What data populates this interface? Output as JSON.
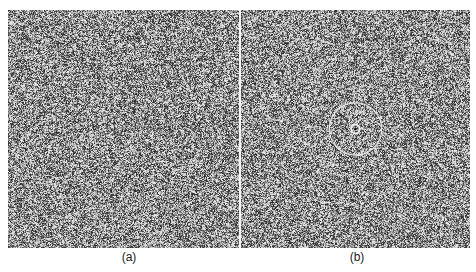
{
  "figure": {
    "panels": [
      {
        "id": "a",
        "label": "(a)",
        "description": "random dot noise pattern",
        "rings": []
      },
      {
        "id": "b",
        "label": "(b)",
        "description": "random dot noise pattern with embedded concentric circular structure",
        "rings_relative_radius": [
          0.012,
          0.11,
          0.2,
          0.31
        ],
        "ring_strength": [
          1.0,
          0.85,
          0.35,
          0.2
        ]
      }
    ],
    "colors": {
      "background_gray": "#6e6e6e",
      "dot_light": "#e6e6e6",
      "dot_dark": "#222222",
      "ring": "#f0f0f0",
      "divider": "#f4f4f4"
    }
  }
}
